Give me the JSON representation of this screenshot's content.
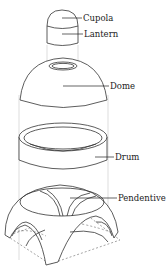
{
  "diagram": {
    "type": "exploded architectural diagram",
    "labels": [
      {
        "id": "cupola",
        "text": "Cupola"
      },
      {
        "id": "lantern",
        "text": "Lantern"
      },
      {
        "id": "dome",
        "text": "Dome"
      },
      {
        "id": "drum",
        "text": "Drum"
      },
      {
        "id": "pendentive",
        "text": "Pendentive"
      }
    ]
  }
}
